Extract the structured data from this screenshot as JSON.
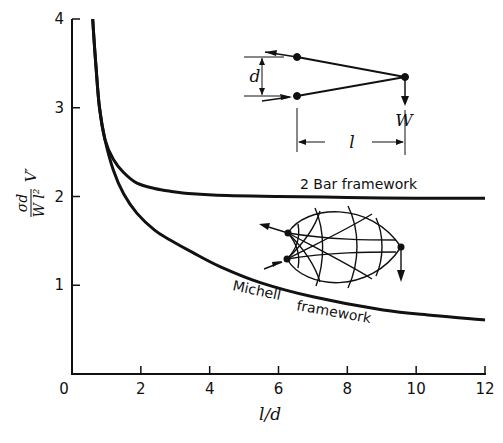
{
  "chart_data": {
    "type": "line",
    "title": "",
    "xlabel": "l/d",
    "ylabel": "σd / (W l²) V′",
    "xlim": [
      0,
      12
    ],
    "ylim": [
      0,
      4
    ],
    "xticks": [
      0,
      2,
      4,
      6,
      8,
      10,
      12
    ],
    "yticks": [
      0,
      1,
      2,
      3,
      4
    ],
    "grid": false,
    "legend": "inline labels",
    "series": [
      {
        "name": "2 Bar framework",
        "x": [
          0.6,
          0.7,
          0.8,
          0.96,
          1.2,
          1.5,
          1.89,
          2.4,
          2.85,
          3.5,
          4.5,
          6,
          8,
          10,
          12
        ],
        "y": [
          4.0,
          3.45,
          3.0,
          2.64,
          2.42,
          2.27,
          2.15,
          2.09,
          2.06,
          2.03,
          2.01,
          2.0,
          1.99,
          1.98,
          1.98
        ]
      },
      {
        "name": "Michell framework",
        "x": [
          0.6,
          0.7,
          0.8,
          0.96,
          1.2,
          1.5,
          1.89,
          2.4,
          2.85,
          3.5,
          4.3,
          5.47,
          7,
          9.04,
          10.5,
          12
        ],
        "y": [
          4.0,
          3.45,
          3.0,
          2.64,
          2.3,
          2.03,
          1.81,
          1.62,
          1.51,
          1.37,
          1.21,
          1.03,
          0.87,
          0.72,
          0.66,
          0.61
        ]
      }
    ],
    "annotations": [
      {
        "text": "2 Bar framework",
        "near": [
          7.2,
          2.05
        ]
      },
      {
        "text": "Michell framework",
        "near": [
          7.0,
          0.9
        ]
      },
      {
        "text": "Inset: 2-bar truss with spacing d, span l, load W",
        "region": "upper right"
      },
      {
        "text": "Inset: Michell truss layout",
        "region": "middle right"
      }
    ]
  },
  "axes": {
    "x_tick_labels": [
      "0",
      "2",
      "4",
      "6",
      "8",
      "10",
      "12"
    ],
    "y_tick_labels": [
      "0",
      "1",
      "2",
      "3",
      "4"
    ],
    "xlabel": "l/d",
    "ylabel_num": "σd",
    "ylabel_den": "W l²",
    "ylabel_suffix": "V′"
  },
  "labels": {
    "two_bar": "2 Bar framework",
    "michell_1": "Michell",
    "michell_2": "framework"
  },
  "inset": {
    "d": "d",
    "W": "W",
    "l": "l"
  }
}
